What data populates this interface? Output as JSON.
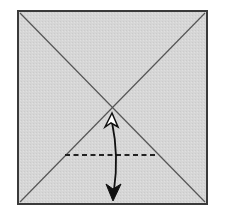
{
  "diagram": {
    "type": "origami-fold-step",
    "paper": {
      "shape": "square",
      "fill": "#d6d6d6",
      "border": "#3a3a3a",
      "x1": 18,
      "y1": 11,
      "x2": 207,
      "y2": 204
    },
    "crease_lines": [
      {
        "from": [
          20,
          13
        ],
        "to": [
          205,
          202
        ],
        "style": "solid",
        "color": "#555555"
      },
      {
        "from": [
          205,
          13
        ],
        "to": [
          20,
          202
        ],
        "style": "solid",
        "color": "#555555"
      }
    ],
    "valley_fold_line": {
      "from": [
        65,
        155
      ],
      "to": [
        158,
        155
      ],
      "style": "dashed",
      "color": "#222222"
    },
    "fold_arrow": {
      "start": [
        112,
        113
      ],
      "end": [
        114,
        200
      ],
      "head_start": "hollow",
      "head_end": "filled",
      "color": "#111111",
      "meaning": "fold bottom edge up to center and unfold"
    },
    "colors": {
      "background": "#ffffff",
      "paper": "#d6d6d6",
      "line": "#555555",
      "arrow": "#111111"
    }
  }
}
